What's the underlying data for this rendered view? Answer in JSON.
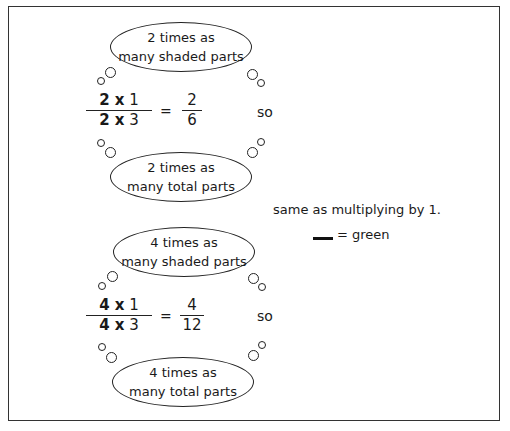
{
  "block1": {
    "top_bubble": {
      "line1": "2 times as",
      "line2": "many shaded parts"
    },
    "fraction_left": {
      "num_factor": "2 x",
      "num_value": "1",
      "den_factor": "2 x",
      "den_value": "3"
    },
    "equals": "=",
    "fraction_right": {
      "num": "2",
      "den": "6"
    },
    "so": "so",
    "bottom_bubble": {
      "line1": "2 times as",
      "line2": "many total parts"
    }
  },
  "block2": {
    "top_bubble": {
      "line1": "4 times as",
      "line2": "many shaded parts"
    },
    "fraction_left": {
      "num_factor": "4 x",
      "num_value": "1",
      "den_factor": "4 x",
      "den_value": "3"
    },
    "equals": "=",
    "fraction_right": {
      "num": "4",
      "den": "12"
    },
    "so": "so",
    "bottom_bubble": {
      "line1": "4 times as",
      "line2": "many total parts"
    }
  },
  "note": {
    "text": "same as multiplying by 1.",
    "legend_text": "= green",
    "legend_color": "#111111"
  }
}
